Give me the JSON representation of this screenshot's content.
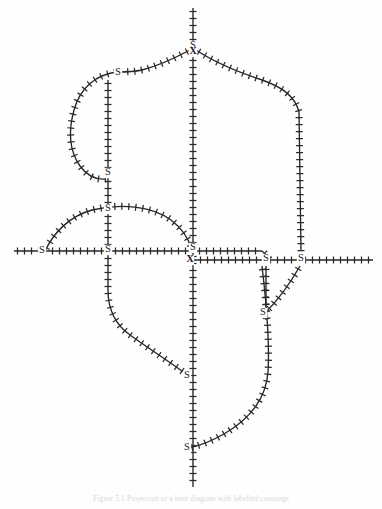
{
  "figure": {
    "background_color": "#fefefe",
    "ink_color": "#262626",
    "caption": "Figure 5.1  Projection of a knot diagram with labelled crossings",
    "line_style": "hatched",
    "tick_spacing": 7.0,
    "tick_length": 7.0,
    "stroke_width": 1.35
  },
  "labels": {
    "node_s": "S",
    "crossing_x": "X"
  },
  "nodes": [
    {
      "id": "s-top-apex",
      "label": "S",
      "x": 193,
      "y": 46
    },
    {
      "id": "s-upper-left",
      "label": "S",
      "x": 118,
      "y": 73
    },
    {
      "id": "s-mid-left-stem",
      "label": "S",
      "x": 108,
      "y": 173
    },
    {
      "id": "s-left-branch",
      "label": "S",
      "x": 108,
      "y": 209
    },
    {
      "id": "s-far-left",
      "label": "S",
      "x": 42,
      "y": 251
    },
    {
      "id": "s-left-axis",
      "label": "S",
      "x": 108,
      "y": 250
    },
    {
      "id": "s-center",
      "label": "S",
      "x": 193,
      "y": 248
    },
    {
      "id": "s-right-inner",
      "label": "S",
      "x": 266,
      "y": 259
    },
    {
      "id": "s-right-outer",
      "label": "S",
      "x": 301,
      "y": 259
    },
    {
      "id": "s-right-lower",
      "label": "S",
      "x": 263,
      "y": 313
    },
    {
      "id": "s-bottom-upper",
      "label": "S",
      "x": 187,
      "y": 376
    },
    {
      "id": "s-bottom-lower",
      "label": "S",
      "x": 187,
      "y": 448
    }
  ],
  "crossings": [
    {
      "id": "x-top-apex",
      "label": "X",
      "x": 193,
      "y": 52
    },
    {
      "id": "x-center",
      "label": "X",
      "x": 190,
      "y": 260
    }
  ],
  "strands": [
    {
      "id": "vertical-main-axis",
      "description": "long vertical axis running full height through centre"
    },
    {
      "id": "horizontal-main-axis",
      "description": "long horizontal axis at mid height"
    },
    {
      "id": "horizontal-lower-axis",
      "description": "second horizontal axis offset below centre, to the right"
    },
    {
      "id": "upper-left-loop",
      "description": "closed loop arc top-left of apex"
    },
    {
      "id": "upper-right-arc",
      "description": "wide arc from apex sweeping right and down"
    },
    {
      "id": "left-hump-arc",
      "description": "arc hump left of centre above mid axis"
    },
    {
      "id": "left-descending-arc",
      "description": "arc descending from left axis to lower centre"
    },
    {
      "id": "right-descending-arc",
      "description": "arc descending from right to bottom centre"
    },
    {
      "id": "left-vertical-branch",
      "description": "vertical branch at x=108"
    },
    {
      "id": "right-vertical-branch",
      "description": "vertical branch at x=266"
    },
    {
      "id": "far-right-vertical",
      "description": "long vertical at x=301"
    }
  ],
  "axes": {
    "vertical_x": 193,
    "horizontal_y": 251,
    "lower_horizontal_y": 260,
    "vertical_top": 8,
    "vertical_bottom": 487,
    "horizontal_left": 14,
    "horizontal_right": 373
  }
}
